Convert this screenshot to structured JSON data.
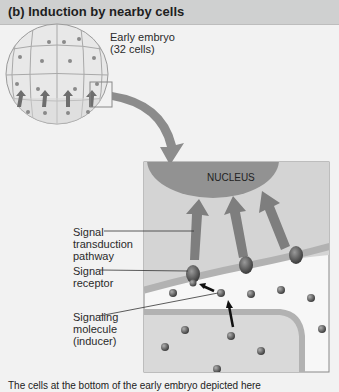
{
  "header": {
    "title": "(b) Induction by nearby cells"
  },
  "embryo": {
    "label_line1": "Early embryo",
    "label_line2": "(32 cells)"
  },
  "inset": {
    "nucleus_label": "NUCLEUS"
  },
  "labels": {
    "transduction": [
      "Signal",
      "transduction",
      "pathway"
    ],
    "receptor": [
      "Signal",
      "receptor"
    ],
    "molecule": [
      "Signaling",
      "molecule",
      "(inducer)"
    ]
  },
  "caption": "The cells at the bottom of the early embryo depicted here",
  "colors": {
    "header_bg": "#cfd0d0",
    "panel_bg": "#f2f2f2",
    "cell_fill": "#e6e6e6",
    "nucleus": "#8f8f8f",
    "arrow": "#7a7a7a",
    "membrane": "#b3b3b3"
  }
}
